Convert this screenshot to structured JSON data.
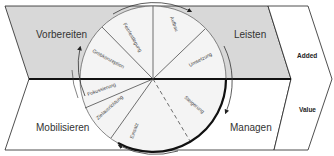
{
  "diagram": {
    "colors": {
      "upper_fill": "#d8d8d8",
      "lower_fill": "#ffffff",
      "circle_fill": "#f0f0f0",
      "stroke": "#222222",
      "divider": "#111111"
    },
    "phases": {
      "top_left": "Vorbereiten",
      "top_right": "Leisten",
      "bottom_left": "Mobilisieren",
      "bottom_right": "Managen"
    },
    "segments": [
      {
        "label": "Feinfestlegung",
        "quadrant": "upper-left"
      },
      {
        "label": "Grobkonzeption",
        "quadrant": "upper-left"
      },
      {
        "label": "Aufbau",
        "quadrant": "upper-right"
      },
      {
        "label": "Umsetzung",
        "quadrant": "upper-right"
      },
      {
        "label": "Fokussierung",
        "quadrant": "lower-left"
      },
      {
        "label": "Zielausrichtung",
        "quadrant": "lower-left"
      },
      {
        "label": "Einsatz",
        "quadrant": "lower-left"
      },
      {
        "label": "Steigerung",
        "quadrant": "lower-right"
      }
    ],
    "side_labels": {
      "top": "Added",
      "bottom": "Value"
    },
    "flow_direction": "clockwise"
  }
}
